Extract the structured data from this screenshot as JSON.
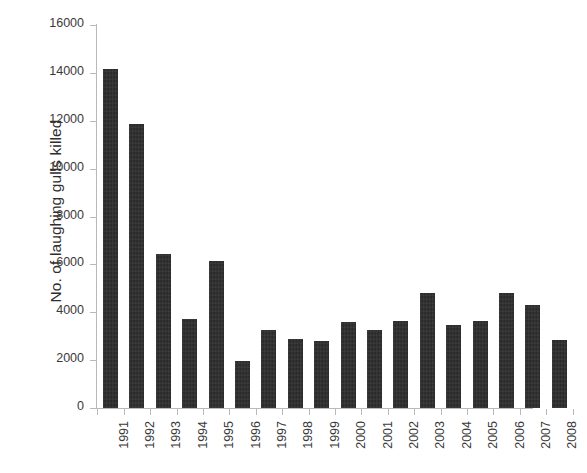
{
  "chart_data": {
    "type": "bar",
    "title": "",
    "xlabel": "",
    "ylabel": "No. of laughing gulls killed",
    "categories": [
      "1991",
      "1992",
      "1993",
      "1994",
      "1995",
      "1996",
      "1997",
      "1998",
      "1999",
      "2000",
      "2001",
      "2002",
      "2003",
      "2004",
      "2005",
      "2006",
      "2007",
      "2008"
    ],
    "values": [
      14150,
      11850,
      6450,
      3700,
      6150,
      1950,
      3250,
      2900,
      2800,
      3600,
      3250,
      3650,
      4800,
      3450,
      3650,
      4800,
      4300,
      2850
    ],
    "ylim": [
      0,
      16000
    ],
    "ytick_labels": [
      "16000",
      "14000",
      "12000",
      "10000",
      "8000",
      "6000",
      "4000",
      "2000",
      "0"
    ],
    "ytick_values": [
      16000,
      14000,
      12000,
      10000,
      8000,
      6000,
      4000,
      2000,
      0
    ],
    "grid": false,
    "legend": "none",
    "bar_color": "#2b2b2b",
    "axis_color": "#b9b9b9",
    "background_color": "#ffffff",
    "text_color": "#3a3a3a"
  }
}
